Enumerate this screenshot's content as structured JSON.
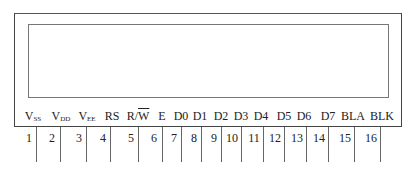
{
  "diagram": {
    "pins": [
      {
        "number": "1",
        "label_main": "V",
        "label_sub": "SS"
      },
      {
        "number": "2",
        "label_main": "V",
        "label_sub": "DD"
      },
      {
        "number": "3",
        "label_main": "V",
        "label_sub": "EE"
      },
      {
        "number": "4",
        "label_main": "RS",
        "label_sub": ""
      },
      {
        "number": "5",
        "label_main": "R/",
        "label_overline": "W"
      },
      {
        "number": "6",
        "label_main": "E",
        "label_sub": ""
      },
      {
        "number": "7",
        "label_main": "D0",
        "label_sub": ""
      },
      {
        "number": "8",
        "label_main": "D1",
        "label_sub": ""
      },
      {
        "number": "9",
        "label_main": "D2",
        "label_sub": ""
      },
      {
        "number": "10",
        "label_main": "D3",
        "label_sub": ""
      },
      {
        "number": "11",
        "label_main": "D4",
        "label_sub": ""
      },
      {
        "number": "12",
        "label_main": "D5",
        "label_sub": ""
      },
      {
        "number": "13",
        "label_main": "D6",
        "label_sub": ""
      },
      {
        "number": "14",
        "label_main": "D7",
        "label_sub": ""
      },
      {
        "number": "15",
        "label_main": "BLA",
        "label_sub": ""
      },
      {
        "number": "16",
        "label_main": "BLK",
        "label_sub": ""
      }
    ]
  }
}
